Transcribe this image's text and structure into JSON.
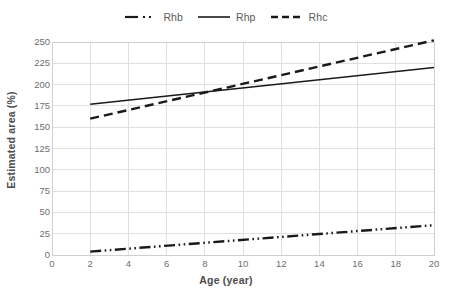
{
  "chart_data": {
    "type": "line",
    "title": "",
    "xlabel": "Age (year)",
    "ylabel": "Estimated area (%)",
    "xlim": [
      0,
      20
    ],
    "ylim": [
      0,
      250
    ],
    "xticks": [
      0,
      2,
      4,
      6,
      8,
      10,
      12,
      14,
      16,
      18,
      20
    ],
    "yticks": [
      0,
      25,
      50,
      75,
      100,
      125,
      150,
      175,
      200,
      225,
      250
    ],
    "grid": true,
    "legend_position": "top-center",
    "series": [
      {
        "name": "Rhb",
        "style": "dash-dot",
        "color": "#1a1a1a",
        "x": [
          2,
          20
        ],
        "values": [
          4,
          35
        ]
      },
      {
        "name": "Rhp",
        "style": "solid",
        "color": "#1a1a1a",
        "x": [
          2,
          20
        ],
        "values": [
          177,
          220
        ]
      },
      {
        "name": "Rhc",
        "style": "dashed",
        "color": "#1a1a1a",
        "x": [
          2,
          20
        ],
        "values": [
          160,
          252
        ]
      }
    ]
  },
  "legend": {
    "entries": [
      {
        "label": "Rhb",
        "icon": "dash-dot-line-icon"
      },
      {
        "label": "Rhp",
        "icon": "solid-line-icon"
      },
      {
        "label": "Rhc",
        "icon": "dashed-line-icon"
      }
    ]
  },
  "axes": {
    "y_title": "Estimated area (%)",
    "x_title": "Age (year)",
    "y_labels": [
      "250",
      "225",
      "200",
      "175",
      "150",
      "125",
      "100",
      "75",
      "50",
      "25",
      "0"
    ],
    "x_labels": [
      "0",
      "2",
      "4",
      "6",
      "8",
      "10",
      "12",
      "14",
      "16",
      "18",
      "20"
    ]
  },
  "colors": {
    "line": "#1a1a1a",
    "grid": "#e0e0e0",
    "border": "#d0d0d0",
    "tick_text": "#6e6e6e",
    "axis_title": "#4d4d4d"
  }
}
